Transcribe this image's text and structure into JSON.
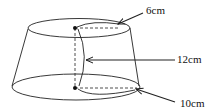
{
  "diagram": {
    "type": "frustum-of-cone",
    "labels": {
      "top": "6cm",
      "middle": "12cm",
      "bottom": "10cm"
    },
    "colors": {
      "stroke": "#222222",
      "background": "#ffffff"
    }
  }
}
